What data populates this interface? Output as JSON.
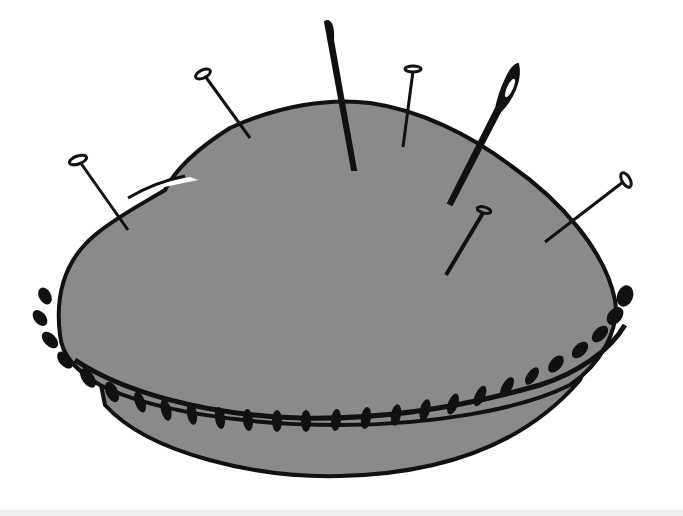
{
  "image": {
    "subject": "pincushion illustration",
    "style": "black ink outline with gray fill",
    "colors": {
      "background": "#ffffff",
      "fill": "#8a8a8a",
      "ink": "#111111",
      "highlight": "#ffffff",
      "bottom_strip": "#eeeeee"
    }
  },
  "pincushion": {
    "pins": [
      {
        "name": "pin-left",
        "head": [
          78,
          160
        ],
        "tip": [
          128,
          230
        ]
      },
      {
        "name": "pin-upper-left",
        "head": [
          203,
          74
        ],
        "tip": [
          250,
          138
        ]
      },
      {
        "name": "pin-top-middle",
        "head": [
          413,
          69
        ],
        "tip": [
          403,
          147
        ]
      },
      {
        "name": "pin-center-right",
        "head": [
          484,
          211
        ],
        "tip": [
          446,
          275
        ]
      },
      {
        "name": "pin-right",
        "head": [
          626,
          180
        ],
        "tip": [
          545,
          242
        ]
      }
    ],
    "needles": [
      {
        "name": "needle-tall",
        "eye": [
          328,
          24
        ],
        "tip": [
          355,
          170
        ]
      },
      {
        "name": "needle-right",
        "eye": [
          513,
          75
        ],
        "tip": [
          450,
          203
        ]
      }
    ]
  }
}
